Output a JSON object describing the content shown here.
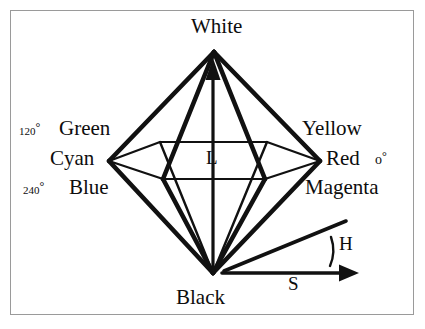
{
  "figure": {
    "type": "diagram",
    "background_color": "#ffffff",
    "stroke_color": "#111111",
    "frame_color": "#9a9a9a"
  },
  "labels": {
    "white": "White",
    "black": "Black",
    "green": "Green",
    "cyan": "Cyan",
    "blue": "Blue",
    "yellow": "Yellow",
    "red": "Red",
    "magenta": "Magenta",
    "lightness_axis": "L",
    "hue_angle": "H",
    "saturation_axis": "S"
  },
  "angles": {
    "green_value": "120",
    "green_symbol": "°",
    "blue_value": "240",
    "blue_symbol": "°",
    "red_value": "o",
    "red_symbol": "°"
  },
  "geometry": {
    "white_apex": [
      214,
      52
    ],
    "black_apex": [
      213,
      273
    ],
    "cyan_vertex": [
      109,
      161
    ],
    "red_vertex": [
      320,
      161
    ],
    "hex_back_left": [
      160,
      142
    ],
    "hex_back_right": [
      267,
      142
    ],
    "hex_front_left": [
      163,
      179
    ],
    "hex_front_right": [
      265,
      179
    ],
    "l_axis_top": [
      213,
      68
    ],
    "l_axis_bottom": [
      213,
      270
    ],
    "s_axis_start": [
      222,
      273
    ],
    "s_axis_end": [
      357,
      273
    ],
    "h_line_start": [
      224,
      271
    ],
    "h_line_end": [
      346,
      222
    ]
  }
}
